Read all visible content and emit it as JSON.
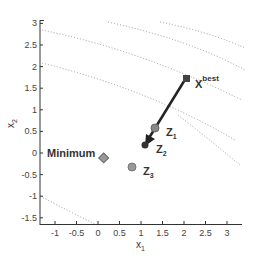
{
  "chart_data": {
    "type": "scatter",
    "title": "",
    "xlabel": "x1",
    "ylabel": "x2",
    "xlim": [
      -1.35,
      3.35
    ],
    "ylim": [
      -1.65,
      3.0
    ],
    "grid": false,
    "x_ticks": [
      "-1",
      "-0.5",
      "0",
      "0.5",
      "1",
      "1.5",
      "2",
      "2.5",
      "3"
    ],
    "y_ticks": [
      "3",
      "2.5",
      "2",
      "1.5",
      "1",
      "0.5",
      "0",
      "-0.5",
      "-1",
      "-1.5"
    ],
    "points": [
      {
        "label": "Minimum",
        "x": 0.0,
        "y": 0.0,
        "marker": "diamond"
      },
      {
        "label": "Z1",
        "x": 1.3,
        "y": 0.57,
        "marker": "circle"
      },
      {
        "label": "Z2",
        "x": 1.1,
        "y": 0.18,
        "marker": "circle"
      },
      {
        "label": "Z3",
        "x": 0.8,
        "y": -0.33,
        "marker": "circle"
      },
      {
        "label": "x_best",
        "x": 2.05,
        "y": 1.7,
        "marker": "square"
      }
    ],
    "arrow": {
      "from": "x_best",
      "to": "Z2"
    },
    "contours": "dotted level curves"
  },
  "labels": {
    "xlabel": "x",
    "xlabel_sub": "1",
    "ylabel": "x",
    "ylabel_sub": "2",
    "minimum": "Minimum",
    "z": "Z",
    "z1_sub": "1",
    "z2_sub": "2",
    "z3_sub": "3",
    "xbest": "X",
    "xbest_sup": "best"
  }
}
